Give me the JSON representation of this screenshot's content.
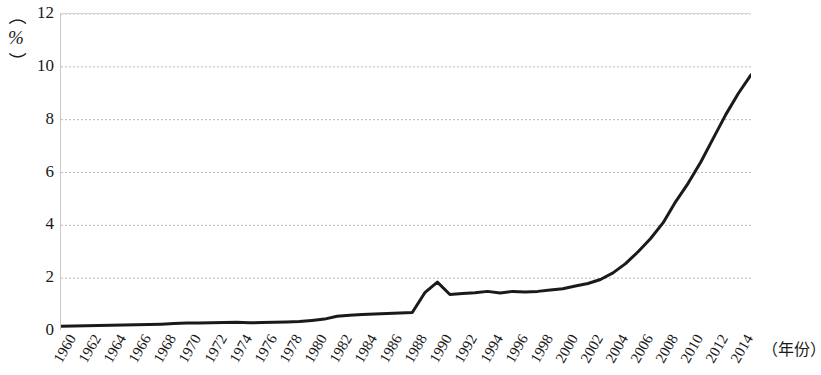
{
  "chart_data": {
    "type": "line",
    "title": "",
    "subtitle": "",
    "xlabel": "（年份）",
    "ylabel": "（%）",
    "y_unit": "%",
    "xlim": [
      1960,
      2015
    ],
    "ylim": [
      0,
      12
    ],
    "grid": true,
    "grid_axis": "y",
    "legend": false,
    "legend_position": "none",
    "line_color": "#1a1a1a",
    "line_width": 3,
    "y_ticks": [
      0,
      2,
      4,
      6,
      8,
      10,
      12
    ],
    "y_tick_labels": [
      "0",
      "2",
      "4",
      "6",
      "8",
      "10",
      "12"
    ],
    "x_ticks": [
      1960,
      1962,
      1964,
      1966,
      1968,
      1970,
      1972,
      1974,
      1976,
      1978,
      1980,
      1982,
      1984,
      1986,
      1988,
      1990,
      1992,
      1994,
      1996,
      1998,
      2000,
      2002,
      2004,
      2006,
      2008,
      2010,
      2012,
      2014
    ],
    "x_tick_labels": [
      "1960",
      "1962",
      "1964",
      "1966",
      "1968",
      "1970",
      "1972",
      "1974",
      "1976",
      "1978",
      "1980",
      "1982",
      "1984",
      "1986",
      "1988",
      "1990",
      "1992",
      "1994",
      "1996",
      "1998",
      "2000",
      "2002",
      "2004",
      "2006",
      "2008",
      "2010",
      "2012",
      "2014"
    ],
    "x": [
      1960,
      1961,
      1962,
      1963,
      1964,
      1965,
      1966,
      1967,
      1968,
      1969,
      1970,
      1971,
      1972,
      1973,
      1974,
      1975,
      1976,
      1977,
      1978,
      1979,
      1980,
      1981,
      1982,
      1983,
      1984,
      1985,
      1986,
      1987,
      1988,
      1989,
      1990,
      1991,
      1992,
      1993,
      1994,
      1995,
      1996,
      1997,
      1998,
      1999,
      2000,
      2001,
      2002,
      2003,
      2004,
      2005,
      2006,
      2007,
      2008,
      2009,
      2010,
      2011,
      2012,
      2013,
      2014,
      2015
    ],
    "values": [
      0.18,
      0.19,
      0.2,
      0.21,
      0.22,
      0.23,
      0.24,
      0.25,
      0.26,
      0.28,
      0.3,
      0.3,
      0.31,
      0.32,
      0.33,
      0.31,
      0.32,
      0.33,
      0.34,
      0.36,
      0.4,
      0.45,
      0.56,
      0.6,
      0.62,
      0.64,
      0.66,
      0.68,
      0.7,
      1.45,
      1.85,
      1.38,
      1.42,
      1.45,
      1.5,
      1.44,
      1.5,
      1.48,
      1.5,
      1.55,
      1.6,
      1.7,
      1.8,
      1.95,
      2.2,
      2.55,
      3.0,
      3.5,
      4.1,
      4.9,
      5.6,
      6.4,
      7.3,
      8.2,
      9.0,
      9.7
    ],
    "series_name": "比例"
  },
  "axis": {
    "y_unit_open_paren": "（",
    "y_unit_symbol": "%",
    "y_unit_close_paren": "）"
  }
}
